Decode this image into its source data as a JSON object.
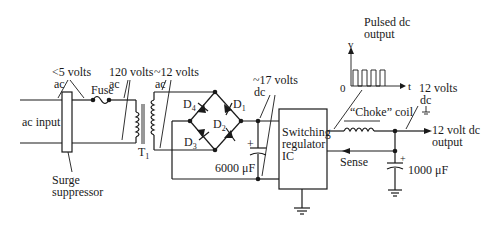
{
  "labels": {
    "ac_input": "ac input",
    "lt5_volts": "<5 volts",
    "lt5_ac": "ac",
    "fuse": "Fuse",
    "v120": "120 volts",
    "v120_ac": "ac",
    "v12ac": "~12 volts",
    "v12ac_ac": "ac",
    "transformer": "T",
    "transformer_sub": "1",
    "surge_1": "Surge",
    "surge_2": "suppressor",
    "d1": "D",
    "d1_sub": "1",
    "d2": "D",
    "d2_sub": "2",
    "d3": "D",
    "d3_sub": "3",
    "d4": "D",
    "d4_sub": "4",
    "v17": "~17 volts",
    "v17_dc": "dc",
    "cap1": "6000 μF",
    "ic_1": "Switching",
    "ic_2": "regulator",
    "ic_3": "IC",
    "pulsed_1": "Pulsed dc",
    "pulsed_2": "output",
    "axis_v": "v",
    "axis_t": "t",
    "axis_0": "0",
    "v12dc": "12 volts",
    "v12dc_dc": "dc",
    "choke": "“Choke” coil",
    "sense": "Sense",
    "out_1": "12 volt dc",
    "out_2": "output",
    "cap2": "1000 μF",
    "plus": "+"
  }
}
